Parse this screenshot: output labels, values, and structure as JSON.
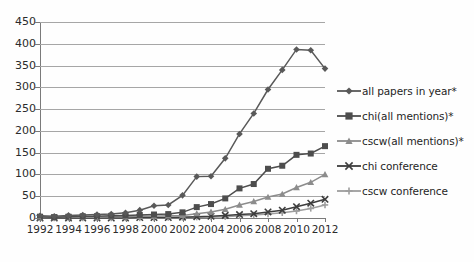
{
  "chart_data": {
    "type": "line",
    "title": "",
    "xlabel": "",
    "ylabel": "",
    "ylim": [
      0,
      450
    ],
    "ytick_step": 50,
    "grid": true,
    "legend_position": "right",
    "x": [
      1992,
      1993,
      1994,
      1995,
      1996,
      1997,
      1998,
      1999,
      2000,
      2001,
      2002,
      2003,
      2004,
      2005,
      2006,
      2007,
      2008,
      2009,
      2010,
      2011,
      2012
    ],
    "xtick_labels": [
      "1992",
      "1994",
      "1996",
      "1998",
      "2000",
      "2002",
      "2004",
      "2006",
      "2008",
      "2010",
      "2012"
    ],
    "ytick_labels": [
      "0",
      "50",
      "100",
      "150",
      "200",
      "250",
      "300",
      "350",
      "400",
      "450"
    ],
    "series": [
      {
        "name": "all papers in year*",
        "marker": "diamond",
        "color": "#595959",
        "values": [
          5,
          4,
          6,
          7,
          8,
          9,
          12,
          18,
          28,
          30,
          52,
          95,
          96,
          137,
          193,
          240,
          295,
          340,
          387,
          385,
          343
        ]
      },
      {
        "name": "chi(all mentions)*",
        "marker": "square",
        "color": "#4d4d4d",
        "values": [
          3,
          2,
          3,
          4,
          4,
          5,
          6,
          7,
          8,
          9,
          13,
          25,
          32,
          45,
          68,
          78,
          113,
          120,
          145,
          148,
          165
        ]
      },
      {
        "name": "cscw(all mentions)*",
        "marker": "triangle",
        "color": "#8c8c8c",
        "values": [
          1,
          1,
          2,
          2,
          2,
          3,
          3,
          4,
          4,
          5,
          6,
          10,
          14,
          20,
          30,
          38,
          48,
          55,
          70,
          82,
          100
        ]
      },
      {
        "name": "chi conference",
        "marker": "x",
        "color": "#3d3d3d",
        "values": [
          0,
          0,
          0,
          0,
          0,
          0,
          0,
          1,
          1,
          1,
          2,
          3,
          4,
          6,
          8,
          10,
          14,
          18,
          26,
          34,
          43
        ]
      },
      {
        "name": "cscw conference",
        "marker": "cross",
        "color": "#9e9e9e",
        "values": [
          0,
          0,
          0,
          0,
          0,
          0,
          0,
          0,
          0,
          1,
          1,
          2,
          2,
          3,
          5,
          7,
          9,
          12,
          16,
          22,
          30
        ]
      }
    ]
  },
  "legend": {
    "items": [
      {
        "label": "all papers in year*",
        "marker": "diamond-marker-icon"
      },
      {
        "label": "chi(all mentions)*",
        "marker": "square-marker-icon"
      },
      {
        "label": "cscw(all mentions)*",
        "marker": "triangle-marker-icon"
      },
      {
        "label": "chi conference",
        "marker": "x-marker-icon"
      },
      {
        "label": "cscw conference",
        "marker": "cross-marker-icon"
      }
    ]
  }
}
